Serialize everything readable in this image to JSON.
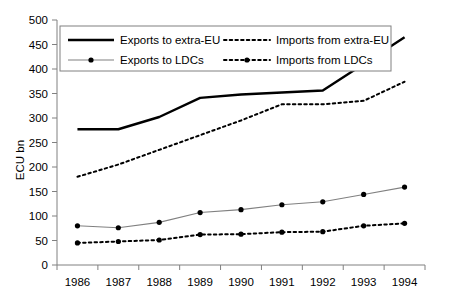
{
  "chart_data": {
    "type": "line",
    "title": "",
    "xlabel": "",
    "ylabel": "ECU bn",
    "categories": [
      "1986",
      "1987",
      "1988",
      "1989",
      "1990",
      "1991",
      "1992",
      "1993",
      "1994"
    ],
    "ylim": [
      0,
      500
    ],
    "ytick_step": 50,
    "yticks": [
      "0",
      "50",
      "100",
      "150",
      "200",
      "250",
      "300",
      "350",
      "400",
      "450",
      "500"
    ],
    "grid": false,
    "legend_position": "top-left-inside",
    "series": [
      {
        "name": "Exports to extra-EU",
        "style": "solid-thick",
        "markers": false,
        "color": "#000000",
        "values": [
          277,
          277,
          302,
          341,
          348,
          352,
          356,
          410,
          465
        ]
      },
      {
        "name": "Imports from extra-EU",
        "style": "dotted",
        "markers": false,
        "color": "#000000",
        "values": [
          180,
          205,
          235,
          265,
          295,
          328,
          328,
          335,
          374
        ]
      },
      {
        "name": "Exports to LDCs",
        "style": "solid-thin",
        "markers": true,
        "color": "#808080",
        "marker_color": "#000000",
        "values": [
          80,
          76,
          87,
          107,
          113,
          123,
          129,
          144,
          159
        ]
      },
      {
        "name": "Imports from LDCs",
        "style": "dash-dot",
        "markers": true,
        "color": "#000000",
        "marker_color": "#000000",
        "values": [
          45,
          48,
          51,
          62,
          63,
          67,
          68,
          80,
          85
        ]
      }
    ]
  },
  "axis": {
    "y_title": "ECU bn",
    "y_ticks": [
      "500",
      "450",
      "400",
      "350",
      "300",
      "250",
      "200",
      "150",
      "100",
      "50",
      "0"
    ],
    "x_ticks": [
      "1986",
      "1987",
      "1988",
      "1989",
      "1990",
      "1991",
      "1992",
      "1993",
      "1994"
    ]
  },
  "legend": {
    "entries": [
      {
        "label": "Exports to extra-EU",
        "key": "exports-extra-eu"
      },
      {
        "label": "Imports from extra-EU",
        "key": "imports-extra-eu"
      },
      {
        "label": "Exports to LDCs",
        "key": "exports-ldcs"
      },
      {
        "label": "Imports from LDCs",
        "key": "imports-ldcs"
      }
    ]
  }
}
